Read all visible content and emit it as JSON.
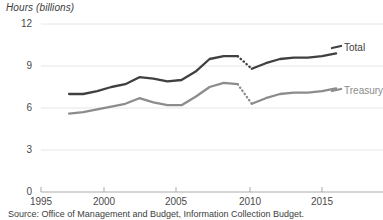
{
  "chart_data": {
    "type": "line",
    "title": "",
    "ylabel": "Hours (billions)",
    "xlabel": "",
    "ylim": [
      0,
      12
    ],
    "xlim": [
      1995,
      2017
    ],
    "yticks": [
      0,
      3,
      6,
      9,
      12
    ],
    "xticks": [
      1995,
      2000,
      2005,
      2010,
      2015
    ],
    "grid": "horizontal",
    "legend_position": "right-inline",
    "x": [
      1997,
      1998,
      1999,
      2000,
      2001,
      2002,
      2003,
      2004,
      2005,
      2006,
      2007,
      2008,
      2009,
      2010,
      2011,
      2012,
      2013,
      2014,
      2015,
      2016
    ],
    "series": [
      {
        "name": "Total",
        "color": "#404040",
        "values": [
          7.0,
          7.0,
          7.2,
          7.5,
          7.7,
          8.2,
          8.1,
          7.9,
          8.0,
          8.6,
          9.5,
          9.7,
          9.7,
          8.8,
          9.2,
          9.5,
          9.6,
          9.6,
          9.7,
          9.9
        ],
        "break_segment": {
          "from_year": 2009,
          "to_year": 2010,
          "from_value": 9.7,
          "to_value": 8.8,
          "style": "dotted"
        }
      },
      {
        "name": "Treasury",
        "color": "#8c8c8c",
        "values": [
          5.6,
          5.7,
          5.9,
          6.1,
          6.3,
          6.7,
          6.4,
          6.2,
          6.2,
          6.8,
          7.5,
          7.8,
          7.7,
          6.3,
          6.7,
          7.0,
          7.1,
          7.1,
          7.2,
          7.4
        ],
        "break_segment": {
          "from_year": 2009,
          "to_year": 2010,
          "from_value": 7.7,
          "to_value": 6.3,
          "style": "dotted"
        }
      }
    ],
    "source_note": "Source: Office of Management and Budget, Information Collection Budget."
  },
  "axis": {
    "y_title": "Hours (billions)",
    "y_labels": [
      "12",
      "9",
      "6",
      "3",
      "0"
    ],
    "x_labels": [
      "1995",
      "2000",
      "2005",
      "2010",
      "2015"
    ]
  },
  "legend": {
    "total_label": "Total",
    "treasury_label": "Treasury"
  },
  "footer": {
    "source": "Source: Office of Management and Budget, Information Collection Budget."
  }
}
